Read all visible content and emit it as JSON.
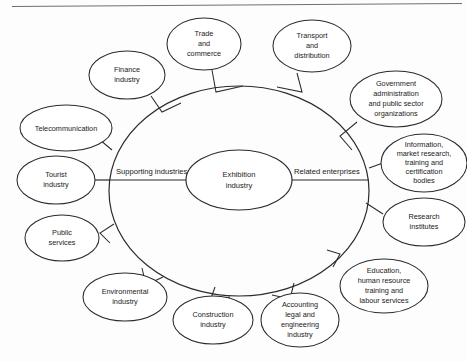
{
  "figure": {
    "type": "radial-concept-diagram",
    "center_node": {
      "name": "exhibition-industry",
      "lines": [
        "Exhibition",
        "industry"
      ]
    },
    "axis_labels": {
      "left": "Supporting industries",
      "right": "Related enterprises"
    },
    "supporting_industries": [
      {
        "name": "finance-industry",
        "lines": [
          "Finance",
          "industry"
        ]
      },
      {
        "name": "trade-and-commerce",
        "lines": [
          "Trade",
          "and",
          "commerce"
        ]
      },
      {
        "name": "telecommunication",
        "lines": [
          "Telecommunication"
        ]
      },
      {
        "name": "tourist-industry",
        "lines": [
          "Tourist",
          "industry"
        ]
      },
      {
        "name": "public-services",
        "lines": [
          "Public",
          "services"
        ]
      },
      {
        "name": "environmental-industry",
        "lines": [
          "Environmental",
          "industry"
        ]
      },
      {
        "name": "construction-industry",
        "lines": [
          "Construction",
          "industry"
        ]
      }
    ],
    "related_enterprises": [
      {
        "name": "transport-and-distribution",
        "lines": [
          "Transport",
          "and",
          "distribution"
        ]
      },
      {
        "name": "government-administration",
        "lines": [
          "Government",
          "administration",
          "and public sector",
          "organizations"
        ]
      },
      {
        "name": "information-market-research",
        "lines": [
          "Information,",
          "market research,",
          "training and",
          "certification",
          "bodies"
        ]
      },
      {
        "name": "research-institutes",
        "lines": [
          "Research",
          "institutes"
        ]
      },
      {
        "name": "education-human-resource",
        "lines": [
          "Education,",
          "human resource",
          "training and",
          "labour services"
        ]
      },
      {
        "name": "accounting-legal-engineering",
        "lines": [
          "Accounting",
          "legal and",
          "engineering",
          "industry"
        ]
      }
    ],
    "colors": {
      "stroke": "#2b2b2b",
      "fill": "#ffffff",
      "background": "#fdfdfd",
      "frame": "#707070",
      "text": "#1a1a1a"
    }
  }
}
